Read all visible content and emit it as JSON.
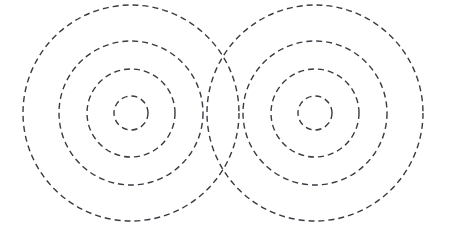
{
  "figure": {
    "name": "concentric-dashed-circles-pattern",
    "width": 449,
    "height": 233,
    "background_color": "#ffffff",
    "stroke_color": "#3a3a42",
    "stroke_width": 1.4,
    "dash_pattern": "6 4",
    "systems": [
      {
        "name": "left-circle-system",
        "center_x": 131,
        "center_y": 113,
        "radii": [
          17,
          44,
          72,
          108
        ]
      },
      {
        "name": "right-circle-system",
        "center_x": 315,
        "center_y": 113,
        "radii": [
          17,
          44,
          72,
          108
        ]
      }
    ]
  },
  "chart_data": {
    "type": "scatter",
    "title": "",
    "subtitle": "",
    "xlabel": "",
    "ylabel": "",
    "xlim": [
      0,
      449
    ],
    "ylim": [
      0,
      233
    ],
    "grid": false,
    "legend": "none",
    "annotations": [],
    "series": [
      {
        "name": "left-circle-system",
        "shape": "concentric-circles",
        "center": [
          131,
          113
        ],
        "radii": [
          17,
          44,
          72,
          108
        ],
        "linestyle": "dashed",
        "color": "#3a3a42"
      },
      {
        "name": "right-circle-system",
        "shape": "concentric-circles",
        "center": [
          315,
          113
        ],
        "radii": [
          17,
          44,
          72,
          108
        ],
        "linestyle": "dashed",
        "color": "#3a3a42"
      }
    ]
  }
}
